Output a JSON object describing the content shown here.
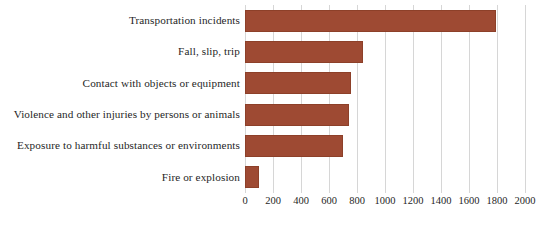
{
  "chart_data": {
    "type": "bar",
    "orientation": "horizontal",
    "title": "",
    "subtitle": "",
    "xlabel": "",
    "ylabel": "",
    "categories": [
      "Transportation incidents",
      "Fall, slip, trip",
      "Contact with objects or equipment",
      "Violence and other injuries by persons or animals",
      "Exposure to harmful substances or environments",
      "Fire or explosion"
    ],
    "values": [
      1790,
      840,
      760,
      745,
      700,
      100
    ],
    "series": [
      {
        "name": "",
        "values": [
          1790,
          840,
          760,
          745,
          700,
          100
        ]
      }
    ],
    "xlim": [
      0,
      2000
    ],
    "xticks": [
      0,
      200,
      400,
      600,
      800,
      1000,
      1200,
      1400,
      1600,
      1800,
      2000
    ],
    "xtick_labels": [
      "0",
      "200",
      "400",
      "600",
      "800",
      "1000",
      "1200",
      "1400",
      "1600",
      "1800",
      "2000"
    ],
    "tick_interval": 200,
    "grid": "vertical",
    "legend": "none",
    "bar_color": "#9e4a33",
    "gridline_color": "#d6d6d6",
    "background_color": "#ffffff"
  }
}
